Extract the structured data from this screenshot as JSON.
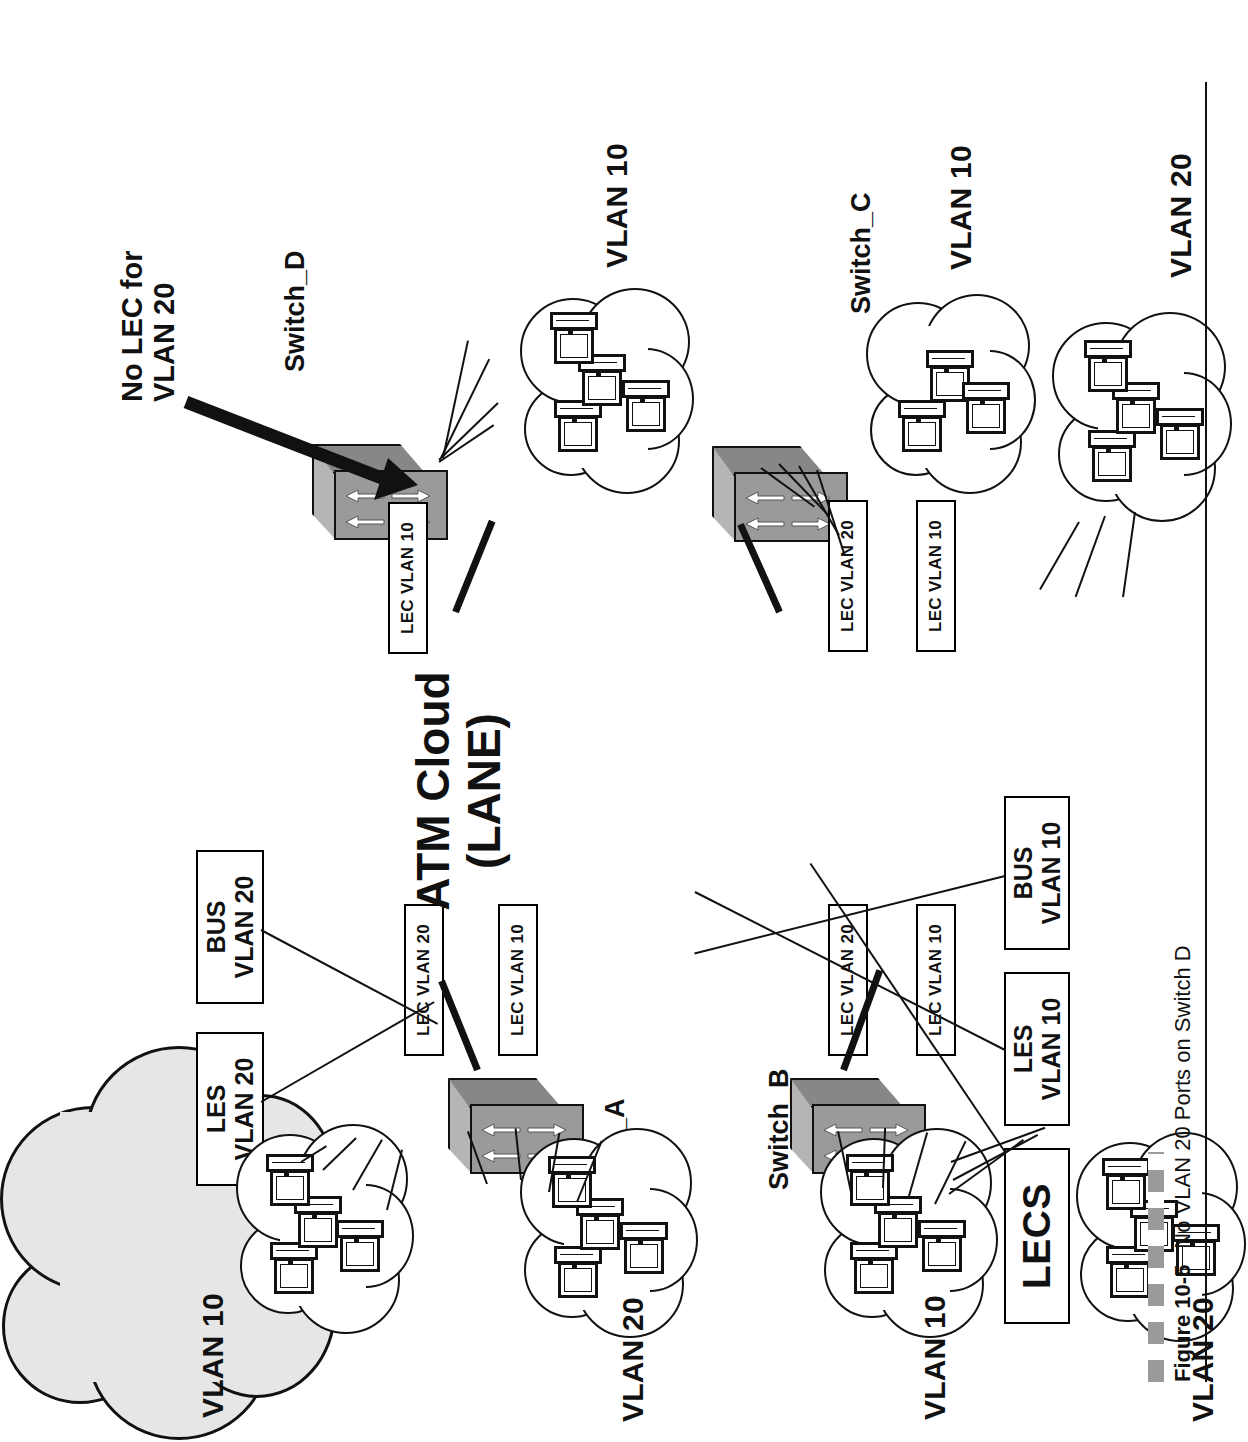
{
  "figure": {
    "number": "Figure 10-5",
    "caption": "No VLAN 20 Ports on Switch D"
  },
  "core": {
    "cloud_label_line1": "ATM Cloud",
    "cloud_label_line2": "(LANE)",
    "cloud_fill": "#e6e6e6"
  },
  "annotations": {
    "no_lec_line1": "No LEC for",
    "no_lec_line2": "VLAN 20"
  },
  "services": [
    {
      "id": "lecs",
      "line1": "LECS",
      "line2": ""
    },
    {
      "id": "les-v10",
      "line1": "LES",
      "line2": "VLAN 10"
    },
    {
      "id": "bus-v10",
      "line1": "BUS",
      "line2": "VLAN 10"
    },
    {
      "id": "les-v20",
      "line1": "LES",
      "line2": "VLAN 20"
    },
    {
      "id": "bus-v20",
      "line1": "BUS",
      "line2": "VLAN 20"
    }
  ],
  "switches": [
    {
      "id": "switch-a",
      "label": "Switch_A",
      "lecs": [
        "LEC VLAN 20",
        "LEC VLAN 10"
      ]
    },
    {
      "id": "switch-b",
      "label": "Switch_B",
      "lecs": [
        "LEC VLAN 20",
        "LEC VLAN 10"
      ]
    },
    {
      "id": "switch-c",
      "label": "Switch_C",
      "lecs": [
        "LEC VLAN 20",
        "LEC VLAN 10"
      ]
    },
    {
      "id": "switch-d",
      "label": "Switch_D",
      "lecs": [
        "LEC VLAN 10"
      ]
    }
  ],
  "lec_labels": {
    "a_v20": "LEC VLAN 20",
    "a_v10": "LEC VLAN 10",
    "b_v20": "LEC VLAN 20",
    "b_v10": "LEC VLAN 10",
    "c_v20": "LEC VLAN 20",
    "c_v10": "LEC VLAN 10",
    "d_v10": "LEC VLAN 10"
  },
  "vlan_clouds": [
    {
      "id": "a-v10",
      "label": "VLAN 10",
      "hosts": 4,
      "switch": "switch-a"
    },
    {
      "id": "a-v20",
      "label": "VLAN 20",
      "hosts": 4,
      "switch": "switch-a"
    },
    {
      "id": "b-v10",
      "label": "VLAN 10",
      "hosts": 4,
      "switch": "switch-b"
    },
    {
      "id": "b-v20",
      "label": "VLAN 20",
      "hosts": 4,
      "switch": "switch-b"
    },
    {
      "id": "c-v10",
      "label": "VLAN 10",
      "hosts": 3,
      "switch": "switch-c"
    },
    {
      "id": "c-v20",
      "label": "VLAN 20",
      "hosts": 4,
      "switch": "switch-c"
    },
    {
      "id": "d-v10",
      "label": "VLAN 10",
      "hosts": 4,
      "switch": "switch-d"
    }
  ]
}
